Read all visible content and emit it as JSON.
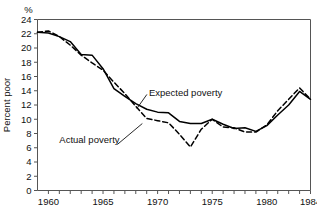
{
  "chart_data": {
    "type": "line",
    "title": "",
    "subtitle": "",
    "xlabel": "",
    "ylabel": "Percent poor",
    "unit_label": "%",
    "xlim": [
      1959,
      1984
    ],
    "ylim": [
      0,
      24
    ],
    "grid": false,
    "legend_position": "inline-annotations",
    "x": [
      1959,
      1960,
      1961,
      1962,
      1963,
      1964,
      1965,
      1966,
      1967,
      1968,
      1969,
      1970,
      1971,
      1972,
      1973,
      1974,
      1975,
      1976,
      1977,
      1978,
      1979,
      1980,
      1981,
      1982,
      1983,
      1984
    ],
    "y_ticks": [
      0,
      2,
      4,
      6,
      8,
      10,
      12,
      14,
      16,
      18,
      20,
      22,
      24
    ],
    "x_ticks": [
      1960,
      1961,
      1962,
      1963,
      1964,
      1965,
      1966,
      1967,
      1968,
      1969,
      1970,
      1971,
      1972,
      1973,
      1974,
      1975,
      1976,
      1977,
      1978,
      1979,
      1980,
      1981,
      1982,
      1983,
      1984
    ],
    "x_tick_labels": [
      "1960",
      "1965",
      "1970",
      "1975",
      "1980",
      "1984"
    ],
    "x_tick_label_values": [
      1960,
      1965,
      1970,
      1975,
      1980,
      1984
    ],
    "series": [
      {
        "name": "Actual poverty",
        "style": "solid",
        "color": "#000000",
        "values": [
          22.2,
          22.1,
          21.6,
          20.9,
          19.1,
          19.0,
          17.1,
          14.3,
          13.2,
          12.2,
          11.4,
          11.0,
          10.9,
          9.7,
          9.4,
          9.4,
          10.0,
          9.3,
          8.7,
          8.8,
          8.3,
          9.1,
          10.6,
          12.0,
          13.9,
          12.8
        ],
        "values_units": "percent"
      },
      {
        "name": "Expected poverty",
        "style": "dashed",
        "color": "#000000",
        "values": [
          22.2,
          22.4,
          21.6,
          20.4,
          19.0,
          17.9,
          16.9,
          15.2,
          13.6,
          11.8,
          10.1,
          9.8,
          9.5,
          7.9,
          6.1,
          8.6,
          10.0,
          8.9,
          8.8,
          8.2,
          8.2,
          9.2,
          11.2,
          12.8,
          14.4,
          12.8
        ],
        "values_units": "percent"
      }
    ],
    "annotations": [
      {
        "text": "Expected poverty",
        "x": 1969.2,
        "y": 13.2
      },
      {
        "text": "Actual poverty",
        "x": 1961.0,
        "y": 6.6
      }
    ]
  }
}
